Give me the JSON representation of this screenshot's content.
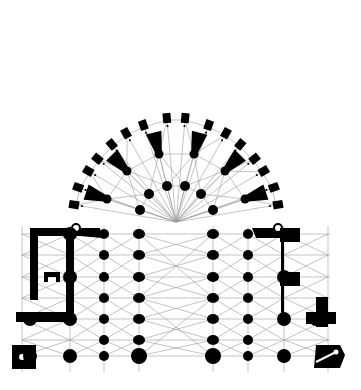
{
  "diagram": {
    "type": "architectural-floor-plan",
    "colors": {
      "background": "#ffffff",
      "solid": "#000000",
      "rib": "#9a9a9a"
    },
    "center": [
      176,
      222
    ],
    "nave_columns_x": [
      104,
      139,
      213,
      248
    ],
    "aisle_rows_y": [
      234,
      255,
      277,
      298,
      319,
      340,
      356
    ],
    "inner_hemicycle_piers": [
      [
        140,
        210
      ],
      [
        149,
        194
      ],
      [
        167,
        186
      ],
      [
        185,
        186
      ],
      [
        201,
        194
      ],
      [
        213,
        210
      ]
    ],
    "ambulatory_piers": [
      [
        107,
        199
      ],
      [
        127,
        171
      ],
      [
        159,
        154
      ],
      [
        194,
        154
      ],
      [
        225,
        171
      ],
      [
        245,
        199
      ]
    ],
    "chapel_buttresses": [
      [
        76,
        205
      ],
      [
        80,
        188
      ],
      [
        90,
        172
      ],
      [
        99,
        160
      ],
      [
        113,
        146
      ],
      [
        127,
        135
      ],
      [
        144,
        127
      ],
      [
        167,
        120
      ],
      [
        185,
        120
      ],
      [
        208,
        127
      ],
      [
        225,
        135
      ],
      [
        239,
        146
      ],
      [
        253,
        160
      ],
      [
        262,
        172
      ],
      [
        272,
        188
      ],
      [
        276,
        205
      ]
    ]
  }
}
